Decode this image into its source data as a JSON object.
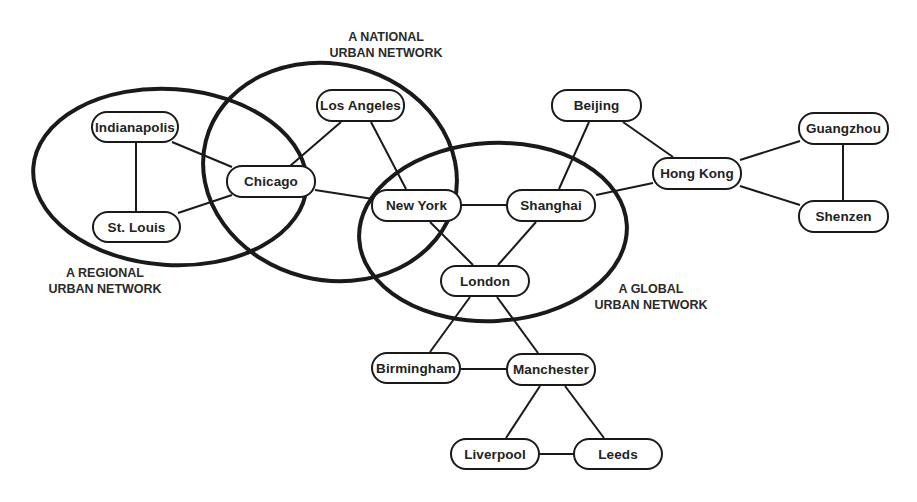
{
  "diagram": {
    "type": "network",
    "networks": [
      {
        "id": "regional",
        "label_line1": "A REGIONAL",
        "label_line2": "URBAN NETWORK"
      },
      {
        "id": "national",
        "label_line1": "A NATIONAL",
        "label_line2": "URBAN NETWORK"
      },
      {
        "id": "global",
        "label_line1": "A GLOBAL",
        "label_line2": "URBAN NETWORK"
      }
    ],
    "nodes": {
      "indianapolis": "Indianapolis",
      "st_louis": "St. Louis",
      "chicago": "Chicago",
      "los_angeles": "Los Angeles",
      "new_york": "New York",
      "shanghai": "Shanghai",
      "london": "London",
      "beijing": "Beijing",
      "hong_kong": "Hong Kong",
      "guangzhou": "Guangzhou",
      "shenzen": "Shenzen",
      "birmingham": "Birmingham",
      "manchester": "Manchester",
      "liverpool": "Liverpool",
      "leeds": "Leeds"
    },
    "edges": [
      [
        "Indianapolis",
        "St. Louis"
      ],
      [
        "Indianapolis",
        "Chicago"
      ],
      [
        "St. Louis",
        "Chicago"
      ],
      [
        "Chicago",
        "Los Angeles"
      ],
      [
        "Chicago",
        "New York"
      ],
      [
        "Los Angeles",
        "New York"
      ],
      [
        "New York",
        "Shanghai"
      ],
      [
        "New York",
        "London"
      ],
      [
        "Shanghai",
        "London"
      ],
      [
        "Shanghai",
        "Beijing"
      ],
      [
        "Shanghai",
        "Hong Kong"
      ],
      [
        "Beijing",
        "Hong Kong"
      ],
      [
        "Hong Kong",
        "Guangzhou"
      ],
      [
        "Hong Kong",
        "Shenzen"
      ],
      [
        "Guangzhou",
        "Shenzen"
      ],
      [
        "London",
        "Birmingham"
      ],
      [
        "London",
        "Manchester"
      ],
      [
        "Birmingham",
        "Manchester"
      ],
      [
        "Manchester",
        "Liverpool"
      ],
      [
        "Manchester",
        "Leeds"
      ],
      [
        "Liverpool",
        "Leeds"
      ]
    ],
    "colors": {
      "stroke": "#1a1a1a",
      "text": "#222222",
      "background": "#ffffff"
    }
  }
}
